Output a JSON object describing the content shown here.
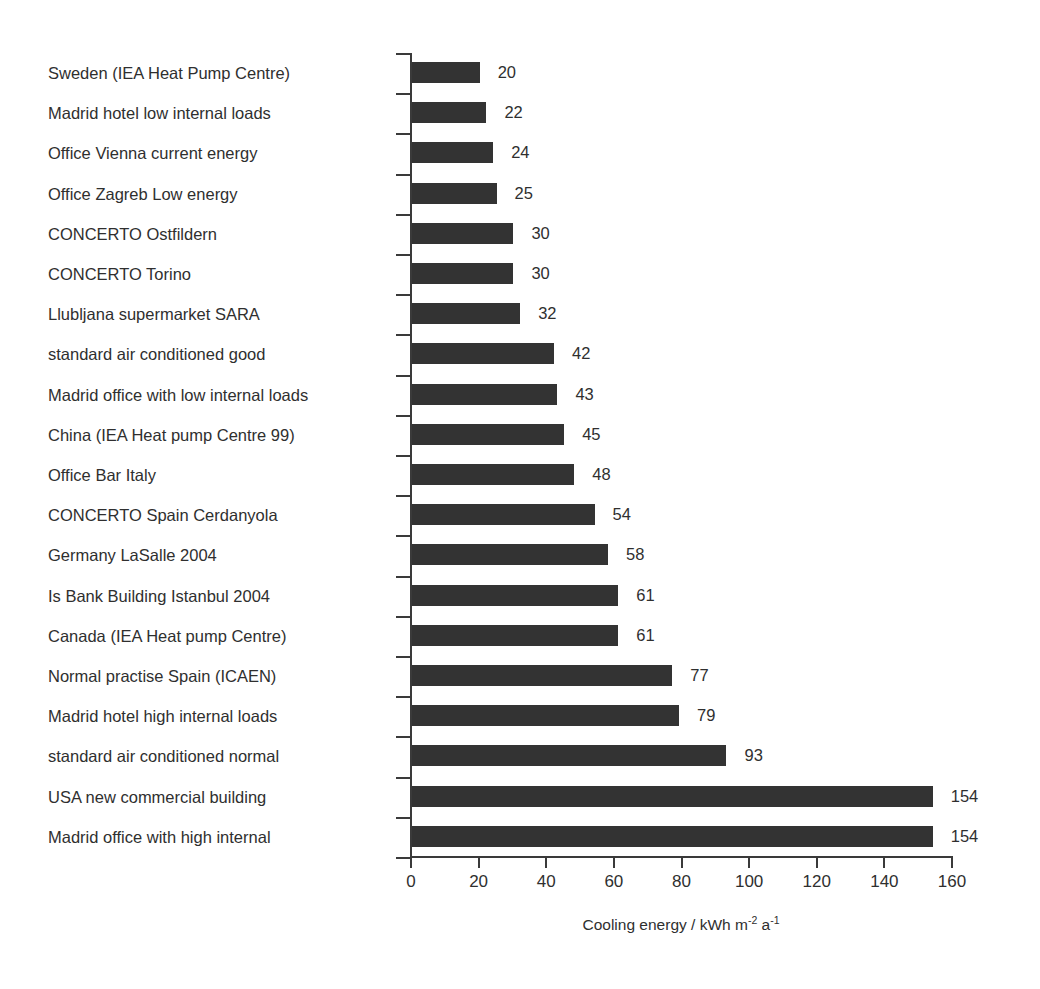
{
  "chart_data": {
    "type": "bar",
    "orientation": "horizontal",
    "title": "",
    "xlabel": "Cooling energy  / kWh m-2 a-1",
    "xlabel_parts": {
      "lead": "Cooling energy  / kWh m",
      "sup1": "-2",
      "mid": " a",
      "sup2": "-1"
    },
    "ylabel": "",
    "xlim": [
      0,
      160
    ],
    "xticks": [
      0,
      20,
      40,
      60,
      80,
      100,
      120,
      140,
      160
    ],
    "xtick_labels": [
      "0",
      "20",
      "40",
      "60",
      "80",
      "100",
      "120",
      "140",
      "160"
    ],
    "grid": false,
    "legend": null,
    "bar_color": "#333333",
    "axis_color": "#3a3a3a",
    "text_color": "#2f2f2f",
    "value_labels_shown": true,
    "categories": [
      "Sweden (IEA Heat Pump Centre)",
      "Madrid hotel low internal loads",
      "Office Vienna current energy",
      "Office Zagreb Low energy",
      "CONCERTO Ostfildern",
      "CONCERTO Torino",
      "Llubljana supermarket SARA",
      "standard air conditioned good",
      "Madrid office with low internal loads",
      "China (IEA Heat pump Centre 99)",
      "Office Bar Italy",
      "CONCERTO Spain Cerdanyola",
      "Germany LaSalle 2004",
      "Is Bank Building Istanbul 2004",
      "Canada (IEA Heat pump Centre)",
      "Normal practise Spain (ICAEN)",
      "Madrid hotel high internal loads",
      "standard air conditioned normal",
      "USA new commercial building",
      "Madrid office with high internal"
    ],
    "values": [
      20,
      22,
      24,
      25,
      30,
      30,
      32,
      42,
      43,
      45,
      48,
      54,
      58,
      61,
      61,
      77,
      79,
      93,
      154,
      154
    ],
    "value_labels": [
      "20",
      "22",
      "24",
      "25",
      "30",
      "30",
      "32",
      "42",
      "43",
      "45",
      "48",
      "54",
      "58",
      "61",
      "61",
      "77",
      "79",
      "93",
      "154",
      "154"
    ]
  }
}
